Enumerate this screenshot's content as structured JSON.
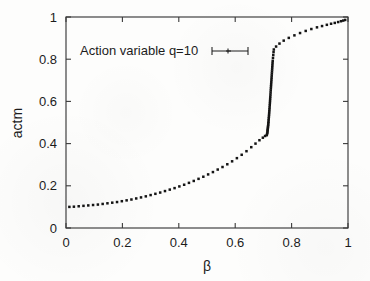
{
  "figure": {
    "background_color": "#fdfdfc",
    "ink_color": "#141414",
    "frame_color": "#3a3a3a"
  },
  "chart_data": {
    "type": "scatter",
    "title": "",
    "subtitle": "",
    "xlabel": "β",
    "ylabel": "actm",
    "xlim": [
      0,
      1
    ],
    "ylim": [
      0,
      1
    ],
    "xticks": [
      0,
      0.2,
      0.4,
      0.6,
      0.8,
      1
    ],
    "xticklabels": [
      "0",
      "0.2",
      "0.4",
      "0.6",
      "0.8",
      "1"
    ],
    "yticks": [
      0,
      0.2,
      0.4,
      0.6,
      0.8,
      1
    ],
    "yticklabels": [
      "0",
      "0.2",
      "0.4",
      "0.6",
      "0.8",
      "1"
    ],
    "grid": false,
    "legend_position": "upper left",
    "marker": "errorbar-point",
    "annotations": [],
    "series": [
      {
        "name": "Action variable q=10",
        "marker": "plus-with-errorbar",
        "color": "#141414",
        "x": [
          0.012,
          0.028,
          0.045,
          0.062,
          0.079,
          0.096,
          0.113,
          0.13,
          0.147,
          0.164,
          0.181,
          0.198,
          0.215,
          0.232,
          0.249,
          0.266,
          0.283,
          0.3,
          0.317,
          0.334,
          0.351,
          0.368,
          0.385,
          0.402,
          0.419,
          0.436,
          0.453,
          0.47,
          0.487,
          0.504,
          0.521,
          0.538,
          0.555,
          0.572,
          0.589,
          0.606,
          0.623,
          0.64,
          0.657,
          0.672,
          0.686,
          0.698,
          0.706,
          0.712,
          0.713,
          0.714,
          0.7145,
          0.715,
          0.7155,
          0.716,
          0.7165,
          0.717,
          0.7175,
          0.718,
          0.7185,
          0.719,
          0.7195,
          0.72,
          0.7205,
          0.721,
          0.7215,
          0.722,
          0.7225,
          0.723,
          0.7235,
          0.724,
          0.7245,
          0.725,
          0.7255,
          0.726,
          0.7265,
          0.727,
          0.7275,
          0.728,
          0.7285,
          0.729,
          0.7295,
          0.73,
          0.7305,
          0.731,
          0.7315,
          0.732,
          0.7325,
          0.733,
          0.734,
          0.735,
          0.736,
          0.737,
          0.745,
          0.757,
          0.772,
          0.79,
          0.81,
          0.83,
          0.85,
          0.87,
          0.89,
          0.908,
          0.925,
          0.94,
          0.953,
          0.965,
          0.975,
          0.983,
          0.99
        ],
        "y": [
          0.1,
          0.101,
          0.103,
          0.105,
          0.107,
          0.109,
          0.111,
          0.114,
          0.117,
          0.12,
          0.123,
          0.127,
          0.131,
          0.135,
          0.14,
          0.145,
          0.15,
          0.156,
          0.162,
          0.168,
          0.175,
          0.182,
          0.189,
          0.197,
          0.205,
          0.214,
          0.223,
          0.233,
          0.243,
          0.254,
          0.265,
          0.277,
          0.289,
          0.302,
          0.316,
          0.331,
          0.347,
          0.364,
          0.383,
          0.4,
          0.416,
          0.428,
          0.436,
          0.44,
          0.446,
          0.452,
          0.458,
          0.464,
          0.47,
          0.476,
          0.482,
          0.489,
          0.496,
          0.503,
          0.511,
          0.519,
          0.527,
          0.536,
          0.545,
          0.554,
          0.563,
          0.572,
          0.582,
          0.592,
          0.602,
          0.612,
          0.622,
          0.632,
          0.642,
          0.652,
          0.662,
          0.672,
          0.682,
          0.692,
          0.702,
          0.712,
          0.722,
          0.732,
          0.742,
          0.752,
          0.762,
          0.772,
          0.782,
          0.792,
          0.806,
          0.82,
          0.834,
          0.846,
          0.86,
          0.874,
          0.888,
          0.901,
          0.913,
          0.924,
          0.934,
          0.943,
          0.951,
          0.957,
          0.963,
          0.968,
          0.972,
          0.976,
          0.98,
          0.983,
          0.986
        ]
      }
    ]
  },
  "legend": {
    "entries": [
      {
        "label": "Action variable q=10"
      }
    ]
  },
  "axes": {
    "x_title": "β",
    "y_title": "actm"
  }
}
